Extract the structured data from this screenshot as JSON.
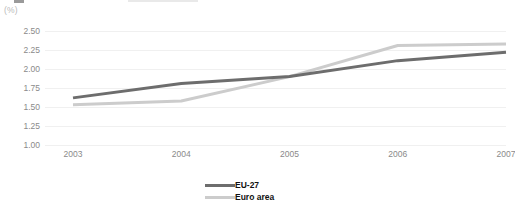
{
  "unit_label": "(%)",
  "colors": {
    "eu27": "#6d6d6d",
    "euro_area": "#cccccc",
    "gridline": "#f0f0f0",
    "tick_text": "#8a8a8a",
    "legend_text": "#111111",
    "background": "#ffffff"
  },
  "legend": {
    "items": [
      {
        "label": "EU-27",
        "color": "#6d6d6d"
      },
      {
        "label": "Euro area",
        "color": "#cccccc"
      }
    ]
  },
  "chart_data": {
    "type": "line",
    "title": "",
    "subtitle": "",
    "xlabel": "",
    "ylabel": "(%)",
    "categories": [
      "2003",
      "2004",
      "2005",
      "2006",
      "2007"
    ],
    "x": [
      2003,
      2004,
      2005,
      2006,
      2007
    ],
    "series": [
      {
        "name": "EU-27",
        "color": "#6d6d6d",
        "values": [
          1.62,
          1.81,
          1.9,
          2.11,
          2.22
        ]
      },
      {
        "name": "Euro area",
        "color": "#cccccc",
        "values": [
          1.53,
          1.58,
          1.9,
          2.31,
          2.33
        ]
      }
    ],
    "ylim": [
      1.0,
      2.5
    ],
    "yticks": [
      2.5,
      2.25,
      2.0,
      1.75,
      1.5,
      1.25,
      1.0
    ],
    "ytick_labels": [
      "2.50",
      "2.25",
      "2.00",
      "1.75",
      "1.50",
      "1.25",
      "1.00"
    ],
    "xtick_labels": [
      "2003",
      "2004",
      "2005",
      "2006",
      "2007"
    ],
    "grid": true,
    "grid_axis": "y",
    "legend_position": "bottom"
  }
}
